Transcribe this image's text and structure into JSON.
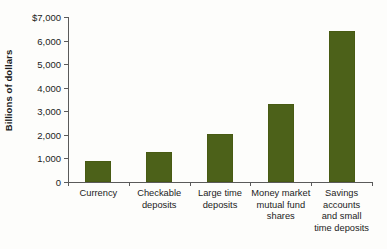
{
  "chart_data": {
    "type": "bar",
    "title": "",
    "subtitle": "",
    "xlabel": "",
    "ylabel": "Billions of dollars",
    "ylim": [
      0,
      7000
    ],
    "ytick_values": [
      0,
      1000,
      2000,
      3000,
      4000,
      5000,
      6000,
      7000
    ],
    "ytick_labels": [
      "0",
      "1,000",
      "2,000",
      "3,000",
      "4,000",
      "5,000",
      "6,000",
      "$7,000"
    ],
    "grid": false,
    "legend": "none",
    "bar_color": "#4c6119",
    "axis_color": "#5a5a5a",
    "categories": [
      "Currency",
      "Checkable\ndeposits",
      "Large time\ndeposits",
      "Money market\nmutual fund\nshares",
      "Savings\naccounts\nand small\ntime deposits"
    ],
    "values": [
      890,
      1270,
      2040,
      3330,
      6420
    ]
  }
}
